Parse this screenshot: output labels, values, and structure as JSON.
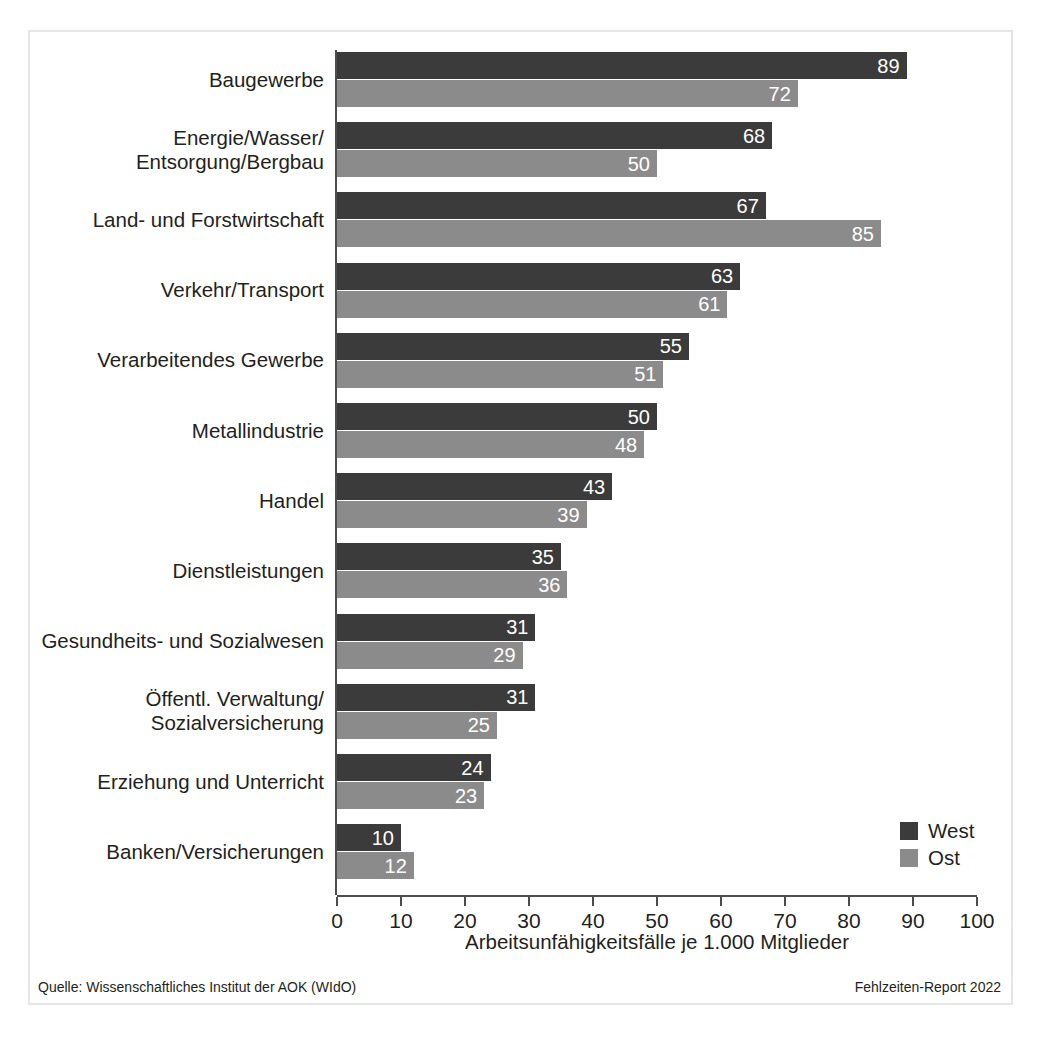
{
  "chart_data": {
    "type": "bar",
    "orientation": "horizontal",
    "title": "",
    "xlabel": "Arbeitsunfähigkeitsfälle je 1.000 Mitglieder",
    "ylabel": "",
    "xlim": [
      0,
      100
    ],
    "xticks": [
      0,
      10,
      20,
      30,
      40,
      50,
      60,
      70,
      80,
      90,
      100
    ],
    "grid": false,
    "legend_position": "bottom-right",
    "categories": [
      "Baugewerbe",
      "Energie/Wasser/\nEntsorgung/Bergbau",
      "Land- und Forstwirtschaft",
      "Verkehr/Transport",
      "Verarbeitendes Gewerbe",
      "Metallindustrie",
      "Handel",
      "Dienstleistungen",
      "Gesundheits- und Sozialwesen",
      "Öffentl. Verwaltung/\nSozialversicherung",
      "Erziehung und Unterricht",
      "Banken/Versicherungen"
    ],
    "series": [
      {
        "name": "West",
        "color": "#3b3b3b",
        "values": [
          89,
          68,
          67,
          63,
          55,
          50,
          43,
          35,
          31,
          31,
          24,
          10
        ]
      },
      {
        "name": "Ost",
        "color": "#8b8b8b",
        "values": [
          72,
          50,
          85,
          61,
          51,
          48,
          39,
          36,
          29,
          25,
          23,
          12
        ]
      }
    ]
  },
  "footer": {
    "source": "Quelle: Wissenschaftliches Institut der AOK (WIdO)",
    "report": "Fehlzeiten-Report 2022"
  }
}
